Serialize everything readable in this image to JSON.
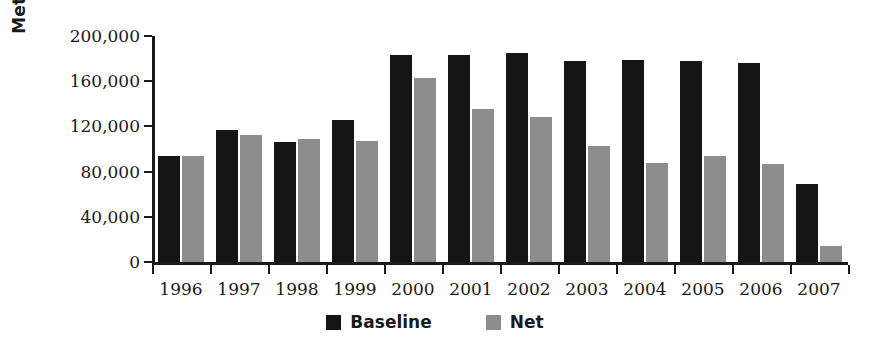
{
  "chart_data": {
    "type": "bar",
    "title": "",
    "xlabel": "",
    "ylabel": "Metric Tons CO2",
    "ylabel_main": "Metric Tons CO",
    "ylabel_sub": "2",
    "ylim": [
      0,
      200000
    ],
    "yticks": [
      0,
      40000,
      80000,
      120000,
      160000,
      200000
    ],
    "ytick_labels": [
      "0",
      "40,000",
      "80,000",
      "120,000",
      "160,000",
      "200,000"
    ],
    "grid": false,
    "legend_position": "bottom-center",
    "categories": [
      "1996",
      "1997",
      "1998",
      "1999",
      "2000",
      "2001",
      "2002",
      "2003",
      "2004",
      "2005",
      "2006",
      "2007"
    ],
    "series": [
      {
        "name": "Baseline",
        "color": "#141414",
        "values": [
          94000,
          117000,
          106000,
          126000,
          183000,
          183000,
          185000,
          178000,
          179000,
          178000,
          176000,
          69000
        ]
      },
      {
        "name": "Net",
        "color": "#8d8d8d",
        "values": [
          94000,
          112000,
          109000,
          107000,
          163000,
          135000,
          128000,
          103000,
          88000,
          94000,
          87000,
          14000
        ]
      }
    ]
  },
  "legend": {
    "items": [
      {
        "label": "Baseline",
        "swatch": "baseline"
      },
      {
        "label": "Net",
        "swatch": "net"
      }
    ]
  }
}
